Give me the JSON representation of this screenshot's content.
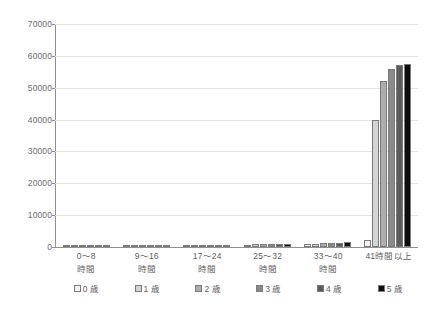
{
  "chart_data": {
    "type": "bar",
    "title": "",
    "subtitle": "",
    "xlabel": "",
    "ylabel": "",
    "ylim": [
      0,
      70000
    ],
    "ytick_step": 10000,
    "yticks": [
      "0",
      "10000",
      "20000",
      "30000",
      "40000",
      "50000",
      "60000",
      "70000"
    ],
    "grid": true,
    "legend_position": "bottom",
    "categories": [
      "0〜8\n時間",
      "9〜16\n時間",
      "17〜24\n時間",
      "25〜32\n時間",
      "33〜40\n時間",
      "41時間以上"
    ],
    "series": [
      {
        "name": "0 歳",
        "color": "#f2f2f2",
        "values": [
          60,
          90,
          150,
          700,
          800,
          2200
        ]
      },
      {
        "name": "1 歳",
        "color": "#d4d4d4",
        "values": [
          50,
          80,
          180,
          1000,
          1100,
          40000
        ]
      },
      {
        "name": "2 歳",
        "color": "#adadad",
        "values": [
          45,
          75,
          170,
          1000,
          1200,
          52000
        ]
      },
      {
        "name": "3 歳",
        "color": "#8a8a8a",
        "values": [
          40,
          70,
          160,
          900,
          1300,
          56000
        ]
      },
      {
        "name": "4 歳",
        "color": "#5c5c5c",
        "values": [
          35,
          65,
          150,
          850,
          1400,
          57000
        ]
      },
      {
        "name": "5 歳",
        "color": "#0d0d0d",
        "values": [
          30,
          60,
          140,
          800,
          1450,
          57500
        ]
      }
    ]
  },
  "legend": {
    "items": [
      {
        "label": "0 歳"
      },
      {
        "label": "1 歳"
      },
      {
        "label": "2 歳"
      },
      {
        "label": "3 歳"
      },
      {
        "label": "4 歳"
      },
      {
        "label": "5 歳"
      }
    ]
  },
  "caption": {
    "text": ""
  },
  "colors": {
    "gridline": "#e3e3e3",
    "axis": "#8f8f8f",
    "text": "#5e5e5e"
  }
}
